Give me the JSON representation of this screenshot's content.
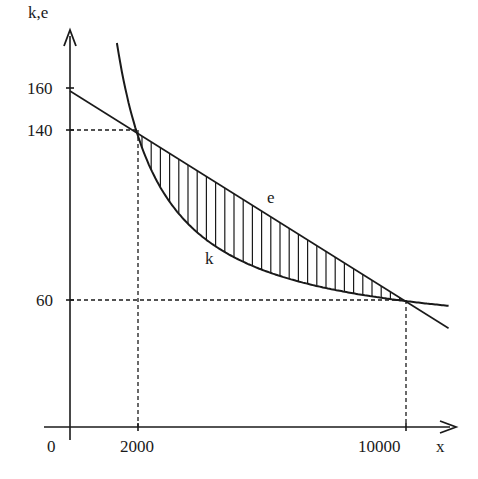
{
  "chart_data": {
    "type": "line",
    "title": "",
    "xlabel": "x",
    "ylabel": "k,e",
    "x_ticks": [
      "0",
      "2000",
      "10000"
    ],
    "y_ticks": [
      "60",
      "140",
      "160"
    ],
    "xlim": [
      0,
      11300
    ],
    "ylim": [
      0,
      185
    ],
    "grid": false,
    "legend": "none (curves labeled inline)",
    "series": [
      {
        "name": "e",
        "kind": "straight line",
        "formula": "e = 160 - 0.01x",
        "points": [
          [
            0,
            160
          ],
          [
            2000,
            140
          ],
          [
            10000,
            60
          ],
          [
            11300,
            47
          ]
        ]
      },
      {
        "name": "k",
        "kind": "hyperbola",
        "formula": "k = 40 + 200000/x",
        "points": [
          [
            1400,
            183
          ],
          [
            2000,
            140
          ],
          [
            3000,
            107
          ],
          [
            4000,
            90
          ],
          [
            5000,
            80
          ],
          [
            6000,
            73
          ],
          [
            8000,
            65
          ],
          [
            10000,
            60
          ],
          [
            11300,
            58
          ]
        ]
      }
    ],
    "annotations": [
      {
        "type": "intersection",
        "x": 2000,
        "y": 140,
        "dashed_guides": true
      },
      {
        "type": "intersection",
        "x": 10000,
        "y": 60,
        "dashed_guides": true
      },
      {
        "type": "hatched_region",
        "between": [
          "e",
          "k"
        ],
        "x_range": [
          2000,
          10000
        ],
        "pattern": "vertical lines"
      },
      {
        "type": "text",
        "label": "e",
        "near": [
          6100,
          103
        ]
      },
      {
        "type": "text",
        "label": "k",
        "near": [
          4300,
          78
        ]
      }
    ]
  },
  "labels": {
    "y_axis": "k,e",
    "x_axis": "x",
    "origin": "0",
    "y160": "160",
    "y140": "140",
    "y60": "60",
    "x2000": "2000",
    "x10000": "10000",
    "curve_e": "e",
    "curve_k": "k"
  },
  "colors": {
    "ink": "#1a1a1a",
    "background": "#ffffff"
  }
}
